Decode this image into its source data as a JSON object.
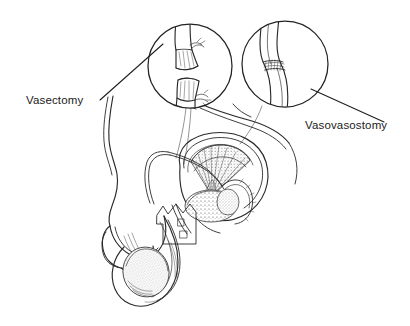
{
  "figure": {
    "type": "medical-line-illustration",
    "background_color": "#ffffff",
    "ink_color": "#2a2a2a",
    "width": 410,
    "height": 326
  },
  "labels": [
    {
      "id": "vasectomy",
      "text": "Vasectomy",
      "position": "left",
      "x": 26,
      "y": 104,
      "leader_from": [
        100,
        100
      ],
      "leader_to": [
        163,
        44
      ]
    },
    {
      "id": "vasovasostomy",
      "text": "Vasovasostomy",
      "position": "right",
      "x": 305,
      "y": 129,
      "leader_from": [
        384,
        122
      ],
      "leader_to": [
        311,
        89
      ]
    }
  ],
  "insets": [
    {
      "id": "vasectomy-inset",
      "label_ref": "vasectomy",
      "center": [
        190,
        66
      ],
      "radius": 42,
      "depicts": "severed vas deferens with both cut ends ligated and clipped",
      "elements": [
        "vas-deferens-upper-stump",
        "vas-deferens-lower-stump",
        "suture-knot-upper",
        "suture-knot-lower"
      ]
    },
    {
      "id": "vasovasostomy-inset",
      "label_ref": "vasovasostomy",
      "center": [
        285,
        64
      ],
      "radius": 43,
      "depicts": "reconnected vas deferens with microsurgical anastomosis sutures",
      "elements": [
        "vas-deferens-continuous",
        "anastomosis-suture-line"
      ]
    }
  ],
  "anatomy": {
    "view": "male reproductive system, sagittal cutaway",
    "structures": [
      {
        "id": "abdomen-torso",
        "name": "abdominal wall and groin contour"
      },
      {
        "id": "penis",
        "name": "penis shaft and glans"
      },
      {
        "id": "scrotum",
        "name": "scrotum"
      },
      {
        "id": "testis-left",
        "name": "testis in scrotum"
      },
      {
        "id": "testis-cutaway",
        "name": "testis cutaway"
      },
      {
        "id": "seminiferous-tubules",
        "name": "seminiferous tubules (fan-shaped lobules)"
      },
      {
        "id": "epididymis",
        "name": "epididymis"
      },
      {
        "id": "vas-deferens",
        "name": "vas deferens (ductus deferens)"
      },
      {
        "id": "spermatic-cord",
        "name": "spermatic cord"
      },
      {
        "id": "callout-bracket",
        "name": "cutaway callout bracket"
      }
    ]
  }
}
